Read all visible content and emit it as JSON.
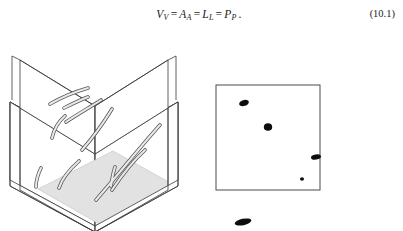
{
  "equation": {
    "label": "(10.1)",
    "terms": [
      {
        "base": "V",
        "sub": "V"
      },
      {
        "base": "A",
        "sub": "A"
      },
      {
        "base": "L",
        "sub": "L"
      },
      {
        "base": "P",
        "sub": "P"
      }
    ],
    "operator": "=",
    "terminator": ".",
    "plain_text": "V_V = A_A = L_L = P_P."
  },
  "figure_left": {
    "name": "fiber-cube-diagram",
    "description": "Isometric open box containing curved fibers, with a shaded horizontal section plane near the base",
    "colors": {
      "box_outline": "#3a3a3a",
      "box_wall_fill": "#ffffff",
      "section_plane_fill": "#e0e0e0",
      "fiber_fill": "#e9e9e9",
      "fiber_outline": "#555555"
    },
    "fiber_count": 10
  },
  "figure_right": {
    "name": "section-plane-profiles",
    "description": "Square section plane showing fiber cross-section profiles as dark blobs",
    "colors": {
      "frame_outline": "#4a4a4a",
      "frame_fill": "#ffffff",
      "profile_fill": "#0d0d0d"
    },
    "profiles": [
      {
        "id": "profile-1",
        "cx": 28,
        "cy": 18,
        "rx": 5.0,
        "ry": 3.0,
        "rot": -18
      },
      {
        "id": "profile-2",
        "cx": 52,
        "cy": 42,
        "rx": 4.2,
        "ry": 3.8,
        "rot": 0
      },
      {
        "id": "profile-3",
        "cx": 100,
        "cy": 72,
        "rx": 5.0,
        "ry": 2.6,
        "rot": -8
      },
      {
        "id": "profile-4",
        "cx": 86,
        "cy": 94,
        "rx": 2.0,
        "ry": 1.8,
        "rot": 0
      },
      {
        "id": "profile-5",
        "cx": 27,
        "cy": 137,
        "rx": 8.5,
        "ry": 3.2,
        "rot": -12
      }
    ],
    "profile_count": 5
  }
}
